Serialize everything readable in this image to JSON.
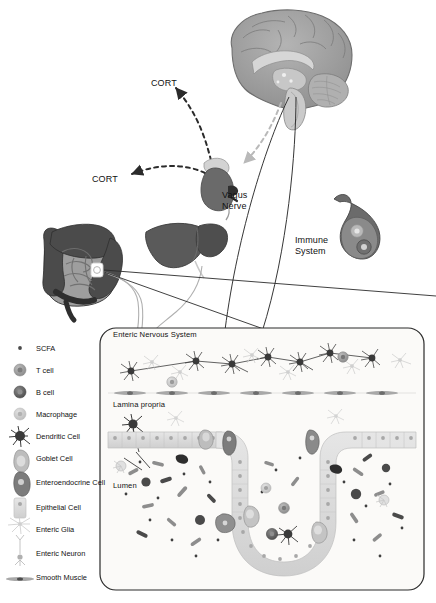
{
  "diagram": {
    "title_present": false,
    "labels": {
      "cort_upper": "CORT",
      "cort_lower": "CORT",
      "vagus_line1": "Vagus",
      "vagus_line2": "Nerve",
      "immune_line1": "Immune",
      "immune_line2": "System",
      "enteric_nervous_system": "Enteric Nervous System",
      "lamina_propria": "Lamina propria",
      "lumen": "Lumen"
    },
    "organs": [
      {
        "name": "brain",
        "label": ""
      },
      {
        "name": "adrenal-gland",
        "label": ""
      },
      {
        "name": "large-intestine",
        "label": ""
      },
      {
        "name": "liver",
        "label": ""
      },
      {
        "name": "immune-organ",
        "label": "Immune System"
      }
    ],
    "legend": [
      {
        "key": "scfa",
        "label": "SCFA",
        "icon": "scfa-dot",
        "color": "#4a4a4a"
      },
      {
        "key": "t-cell",
        "label": "T cell",
        "icon": "t-cell-circle",
        "color": "#8f8f8f"
      },
      {
        "key": "b-cell",
        "label": "B cell",
        "icon": "b-cell-circle",
        "color": "#5b5b5b"
      },
      {
        "key": "macrophage",
        "label": "Macrophage",
        "icon": "macrophage-circle",
        "color": "#c2c2c2"
      },
      {
        "key": "dendritic-cell",
        "label": "Dendritic Cell",
        "icon": "dendritic-star",
        "color": "#3d3d3d"
      },
      {
        "key": "goblet-cell",
        "label": "Goblet Cell",
        "icon": "goblet-shape",
        "color": "#9a9a9a"
      },
      {
        "key": "enteroendocrine-cell",
        "label": "Enteroendocrine Cell",
        "icon": "enteroendocrine-shape",
        "color": "#7c7c7c"
      },
      {
        "key": "epithelial-cell",
        "label": "Epithelial Cell",
        "icon": "epithelial-rect",
        "color": "#d8d8d8"
      },
      {
        "key": "enteric-glia",
        "label": "Enteric Glia",
        "icon": "glia-star",
        "color": "#cfcfcf"
      },
      {
        "key": "enteric-neuron",
        "label": "Enteric Neuron",
        "icon": "neuron-shape",
        "color": "#b5b5b5"
      },
      {
        "key": "smooth-muscle",
        "label": "Smooth Muscle",
        "icon": "smooth-muscle-lens",
        "color": "#a8a8a8"
      }
    ],
    "colors": {
      "background": "#ffffff",
      "text": "#111111",
      "brain_fill": "#9a9a9a",
      "brain_stroke": "#6e6e6e",
      "liver_fill": "#5a5a5a",
      "intestine_dark": "#3f3f3f",
      "intestine_fill": "#9e9e9e",
      "adrenal_fill": "#6a6a6a",
      "panel_border": "#2b2b2b",
      "panel_fill": "#fbfaf8",
      "epithelium_fill": "#dcdcdc",
      "nucleus": "#a0a0a0",
      "arrow_dark": "#2b2b2b",
      "arrow_light": "#b9b9b9"
    },
    "panel": {
      "x": 100,
      "y": 328,
      "width": 324,
      "height": 262
    }
  }
}
